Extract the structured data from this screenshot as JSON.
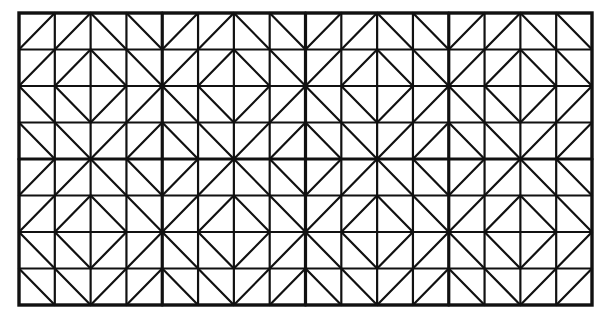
{
  "figure": {
    "grid": {
      "columns": 16,
      "rows": 8,
      "left": 19,
      "top": 13,
      "right": 592,
      "bottom": 305,
      "major_every": 4
    },
    "block_pattern": [
      [
        "/",
        "/",
        "\\",
        "\\"
      ],
      [
        "/",
        "/",
        "\\",
        "\\"
      ],
      [
        "\\",
        "\\",
        "/",
        "/"
      ],
      [
        "\\",
        "\\",
        "/",
        "/"
      ]
    ],
    "colors": {
      "background": "#ffffff",
      "line": "#111111"
    },
    "stroke": {
      "minor": 2.2,
      "diagonal": 2.2,
      "major": 3.2,
      "border": 3.4
    }
  }
}
